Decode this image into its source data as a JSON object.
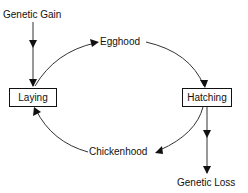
{
  "diagram": {
    "type": "cycle-flow",
    "colors": {
      "line": "#333333",
      "text": "#111111",
      "background": "#ffffff"
    },
    "nodes": {
      "genetic_gain": {
        "label": "Genetic Gain",
        "kind": "text"
      },
      "laying": {
        "label": "Laying",
        "kind": "box"
      },
      "egghood": {
        "label": "Egghood",
        "kind": "text"
      },
      "hatching": {
        "label": "Hatching",
        "kind": "box"
      },
      "chickenhood": {
        "label": "Chickenhood",
        "kind": "text"
      },
      "genetic_loss": {
        "label": "Genetic Loss",
        "kind": "text"
      }
    },
    "edges": [
      {
        "from": "Genetic Gain",
        "to": "Laying",
        "style": "straight"
      },
      {
        "from": "Laying",
        "to": "Egghood",
        "style": "curved"
      },
      {
        "from": "Egghood",
        "to": "Hatching",
        "style": "curved"
      },
      {
        "from": "Hatching",
        "to": "Chickenhood",
        "style": "curved"
      },
      {
        "from": "Chickenhood",
        "to": "Laying",
        "style": "curved"
      },
      {
        "from": "Hatching",
        "to": "Genetic Loss",
        "style": "straight"
      }
    ]
  }
}
